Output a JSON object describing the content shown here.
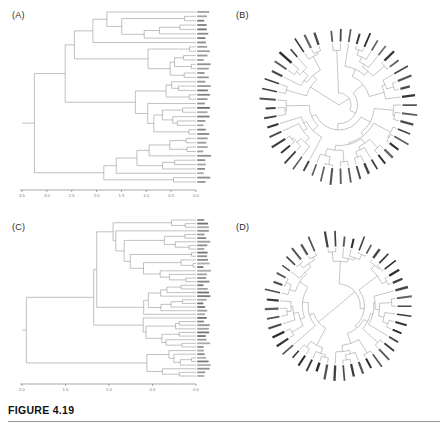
{
  "figure": {
    "caption": "FIGURE 4.19",
    "panels": [
      {
        "id": "A",
        "label": "(A)",
        "type": "rectangular-dendrogram"
      },
      {
        "id": "B",
        "label": "(B)",
        "type": "circular-dendrogram"
      },
      {
        "id": "C",
        "label": "(C)",
        "type": "rectangular-dendrogram"
      },
      {
        "id": "D",
        "label": "(D)",
        "type": "circular-dendrogram"
      }
    ]
  },
  "chart_data": [
    {
      "type": "line",
      "panel": "A",
      "title": "(A)",
      "subtype": "rectangular dendrogram (cluster tree)",
      "xlabel": "",
      "ylabel": "",
      "grid": false,
      "legend": false,
      "axis_direction": "reversed",
      "xlim": [
        3.5,
        0.0
      ],
      "tick_labels": [
        "3.5",
        "3.0",
        "2.5",
        "2.0",
        "1.5",
        "1.0",
        "0.5",
        "0.0"
      ],
      "tick_values": [
        3.5,
        3.0,
        2.5,
        2.0,
        1.5,
        1.0,
        0.5,
        0.0
      ],
      "n_leaves": 40,
      "root_height": 3.25,
      "merge_heights": [
        3.25,
        2.75,
        2.4,
        2.1,
        1.9,
        1.75,
        1.6,
        1.45,
        1.3,
        1.15,
        1.0,
        0.9,
        0.8,
        0.7,
        0.6,
        0.5,
        0.45,
        0.35,
        0.3,
        0.25,
        0.2,
        0.15,
        0.1
      ]
    },
    {
      "type": "line",
      "panel": "B",
      "title": "(B)",
      "subtype": "circular (radial) dendrogram",
      "xlabel": "",
      "ylabel": "",
      "grid": false,
      "legend": false,
      "n_leaves": 48,
      "angular_span_deg": 360,
      "root_radius": 0
    },
    {
      "type": "line",
      "panel": "C",
      "title": "(C)",
      "subtype": "rectangular dendrogram (cluster tree)",
      "xlabel": "",
      "ylabel": "",
      "grid": false,
      "legend": false,
      "axis_direction": "reversed",
      "xlim": [
        2.0,
        0.0
      ],
      "tick_labels": [
        "2.0",
        "1.5",
        "1.0",
        "0.5",
        "0.0"
      ],
      "tick_values": [
        2.0,
        1.5,
        1.0,
        0.5,
        0.0
      ],
      "n_leaves": 44,
      "root_height": 1.95,
      "merge_heights": [
        1.95,
        1.8,
        1.62,
        1.45,
        1.3,
        1.15,
        1.0,
        0.95,
        0.85,
        0.7,
        0.6,
        0.5,
        0.4,
        0.3,
        0.2,
        0.12
      ]
    },
    {
      "type": "line",
      "panel": "D",
      "title": "(D)",
      "subtype": "circular (radial) dendrogram",
      "xlabel": "",
      "ylabel": "",
      "grid": false,
      "legend": false,
      "n_leaves": 46,
      "angular_span_deg": 360,
      "root_radius": 0
    }
  ],
  "colors": {
    "background": "#ffffff",
    "branch": "#8d8d8d",
    "axis": "#6e6e6e",
    "tick_text": "#7a7a7a",
    "tip_text": "#3a3a3a",
    "caption": "#111111",
    "rule": "#9a9a9a"
  }
}
